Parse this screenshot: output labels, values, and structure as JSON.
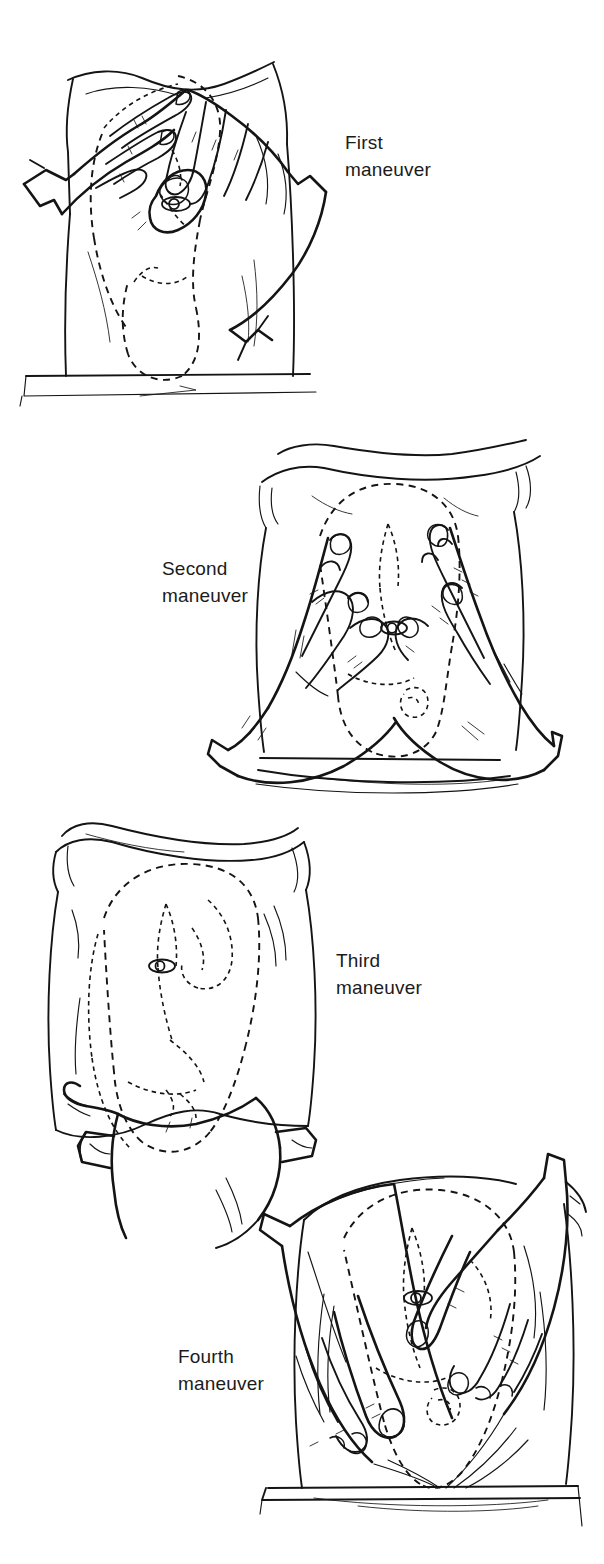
{
  "figure": {
    "background_color": "#ffffff",
    "ink_color": "#141414",
    "text_color": "#1b1b1b",
    "width": 604,
    "height": 1564
  },
  "panels": [
    {
      "id": "first",
      "caption_line_1": "First",
      "caption_line_2": "maneuver",
      "caption_side": "right",
      "hands": "both hands cupping the uterine fundus",
      "landmarks": [
        "umbilicus",
        "examination table edge",
        "gown drape",
        "fetus dashed outline"
      ]
    },
    {
      "id": "second",
      "caption_line_1": "Second",
      "caption_line_2": "maneuver",
      "caption_side": "left",
      "hands": "both hands flat on the lateral sides of the abdomen",
      "landmarks": [
        "umbilicus",
        "examination table edge",
        "gown drape",
        "fetus dashed outline"
      ]
    },
    {
      "id": "third",
      "caption_line_1": "Third",
      "caption_line_2": "maneuver",
      "caption_side": "right",
      "hands": "one hand grasping the lower abdomen above the symphysis",
      "landmarks": [
        "umbilicus",
        "gown drape",
        "fetus dashed outline"
      ]
    },
    {
      "id": "fourth",
      "caption_line_1": "Fourth",
      "caption_line_2": "maneuver",
      "caption_side": "left",
      "hands": "both hands pressing downward toward the pelvic inlet",
      "landmarks": [
        "umbilicus",
        "examination table edge",
        "fetus dashed outline"
      ]
    }
  ]
}
